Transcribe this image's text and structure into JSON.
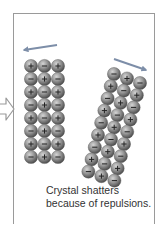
{
  "caption": "Crystal shatters because of repulsions.",
  "colors": {
    "frame": "#9a9a9a",
    "motion_arrow": "#7d8ea8",
    "ion_fill_light": "#b5b5b5",
    "ion_fill_dark": "#4e4e4e",
    "ion_sign": "#222222",
    "entry_arrow_stroke": "#999999"
  },
  "motion_arrows": [
    {
      "name": "left-fragment-motion-arrow",
      "x1": 57,
      "y1": 45,
      "x2": 24,
      "y2": 50
    },
    {
      "name": "right-fragment-motion-arrow",
      "x1": 114,
      "y1": 59,
      "x2": 146,
      "y2": 70
    }
  ],
  "left_fragment": {
    "rows": 8,
    "cols": 3,
    "origin": [
      31,
      66
    ],
    "col_step": [
      13.5,
      0
    ],
    "row_step": [
      0,
      13
    ],
    "radius": 6.6,
    "signs": [
      [
        "+",
        "-",
        "+"
      ],
      [
        "-",
        "+",
        "-"
      ],
      [
        "+",
        "-",
        "+"
      ],
      [
        "-",
        "+",
        "-"
      ],
      [
        "+",
        "-",
        "+"
      ],
      [
        "-",
        "+",
        "-"
      ],
      [
        "+",
        "-",
        "+"
      ],
      [
        "-",
        "+",
        "-"
      ]
    ]
  },
  "right_fragment": {
    "rows": 9,
    "cols": 3,
    "origin": [
      114,
      74
    ],
    "col_step": [
      13,
      4.5
    ],
    "row_step": [
      -3.2,
      12.2
    ],
    "radius": 6.6,
    "signs": [
      [
        "-",
        "+",
        "-"
      ],
      [
        "+",
        "-",
        "+"
      ],
      [
        "-",
        "+",
        "-"
      ],
      [
        "+",
        "-",
        "+"
      ],
      [
        "-",
        "+",
        "-"
      ],
      [
        "+",
        "-",
        "+"
      ],
      [
        "-",
        "+",
        "-"
      ],
      [
        "+",
        "-",
        "+"
      ],
      [
        "-",
        "+",
        "-"
      ]
    ]
  }
}
